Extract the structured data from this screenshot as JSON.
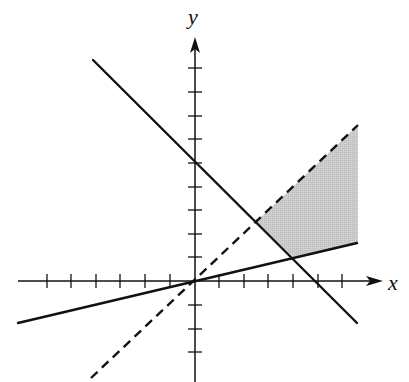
{
  "figure": {
    "type": "linear inequality system graph",
    "axes": {
      "x_label": "x",
      "y_label": "y",
      "x_ticks": [
        -6,
        -5,
        -4,
        -3,
        -2,
        -1,
        1,
        2,
        3,
        4,
        5,
        6
      ],
      "y_ticks": [
        -3,
        -2,
        -1,
        1,
        2,
        3,
        4,
        5,
        6,
        7,
        8,
        9
      ]
    },
    "lines": [
      {
        "name": "x + y = 5",
        "style": "solid",
        "equation": "y = -x + 5",
        "y_intercept": 5,
        "x_intercept": 5
      },
      {
        "name": "y = x",
        "style": "dashed",
        "equation": "y = x"
      },
      {
        "name": "y = x/4",
        "style": "solid",
        "equation": "y = x/4"
      }
    ],
    "shaded_region": {
      "description": "Region above y = x/4, below y = x (dashed, excluded), and to the right of x + y = 5",
      "vertices": [
        [
          2.5,
          2.5
        ],
        [
          4,
          1
        ],
        [
          6.6,
          1.65
        ],
        [
          6.6,
          6.6
        ]
      ],
      "fill": "#c8c8c8"
    },
    "intersections": [
      {
        "lines": [
          "x + y = 5",
          "y = x"
        ],
        "point": [
          2.5,
          2.5
        ]
      },
      {
        "lines": [
          "x + y = 5",
          "y = x/4"
        ],
        "point": [
          4,
          1
        ]
      },
      {
        "lines": [
          "y = x",
          "y = x/4"
        ],
        "point": [
          0,
          0
        ]
      }
    ],
    "colors": {
      "line": "#111111",
      "shade": "#c8c8c8",
      "background": "#ffffff"
    }
  }
}
